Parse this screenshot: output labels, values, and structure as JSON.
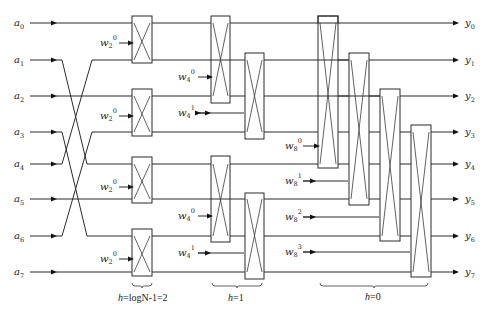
{
  "diagram": {
    "type": "FFT butterfly signal-flow diagram (8-point)",
    "inputs": [
      {
        "base": "a",
        "sub": "0",
        "y": 23
      },
      {
        "base": "a",
        "sub": "1",
        "y": 60
      },
      {
        "base": "a",
        "sub": "2",
        "y": 96
      },
      {
        "base": "a",
        "sub": "3",
        "y": 132
      },
      {
        "base": "a",
        "sub": "4",
        "y": 164
      },
      {
        "base": "a",
        "sub": "5",
        "y": 199
      },
      {
        "base": "a",
        "sub": "6",
        "y": 236
      },
      {
        "base": "a",
        "sub": "7",
        "y": 272
      }
    ],
    "outputs": [
      {
        "base": "y",
        "sub": "0"
      },
      {
        "base": "y",
        "sub": "1"
      },
      {
        "base": "y",
        "sub": "2"
      },
      {
        "base": "y",
        "sub": "3"
      },
      {
        "base": "y",
        "sub": "4"
      },
      {
        "base": "y",
        "sub": "5"
      },
      {
        "base": "y",
        "sub": "6"
      },
      {
        "base": "y",
        "sub": "7"
      }
    ],
    "stages": [
      {
        "caption_prefix": "h",
        "caption_rest": "=logN-1=2",
        "twiddles": [
          {
            "base": "w",
            "sub": "2",
            "sup": "0"
          },
          {
            "base": "w",
            "sub": "2",
            "sup": "0"
          },
          {
            "base": "w",
            "sub": "2",
            "sup": "0"
          },
          {
            "base": "w",
            "sub": "2",
            "sup": "0"
          }
        ]
      },
      {
        "caption_prefix": "h",
        "caption_rest": "=1",
        "twiddles": [
          {
            "base": "w",
            "sub": "4",
            "sup": "0"
          },
          {
            "base": "w",
            "sub": "4",
            "sup": "1"
          },
          {
            "base": "w",
            "sub": "4",
            "sup": "0"
          },
          {
            "base": "w",
            "sub": "4",
            "sup": "1"
          }
        ]
      },
      {
        "caption_prefix": "h",
        "caption_rest": "=0",
        "twiddles": [
          {
            "base": "w",
            "sub": "8",
            "sup": "0"
          },
          {
            "base": "w",
            "sub": "8",
            "sup": "1"
          },
          {
            "base": "w",
            "sub": "8",
            "sup": "2"
          },
          {
            "base": "w",
            "sub": "8",
            "sup": "3"
          }
        ]
      }
    ]
  }
}
